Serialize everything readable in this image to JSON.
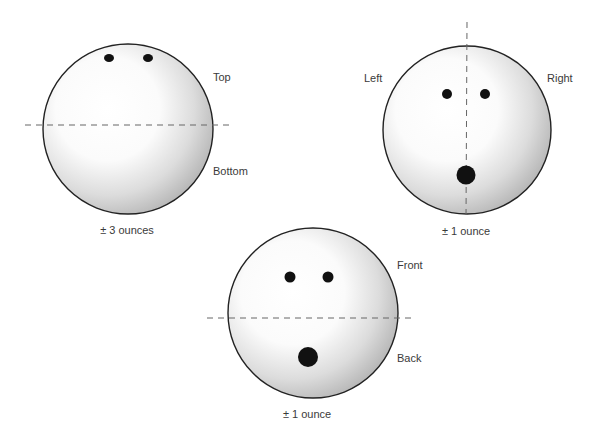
{
  "diagram": {
    "type": "bowling-ball-balance-views",
    "colors": {
      "outline": "#222222",
      "hole": "#111111",
      "dash": "#666666",
      "text": "#3a3a3a"
    },
    "views": [
      {
        "name": "top-bottom",
        "axis": "horizontal",
        "label_a": "Top",
        "label_b": "Bottom",
        "tolerance": "± 3 ounces"
      },
      {
        "name": "left-right",
        "axis": "vertical",
        "label_a": "Left",
        "label_b": "Right",
        "tolerance": "± 1 ounce"
      },
      {
        "name": "front-back",
        "axis": "horizontal",
        "label_a": "Front",
        "label_b": "Back",
        "tolerance": "± 1 ounce"
      }
    ]
  }
}
